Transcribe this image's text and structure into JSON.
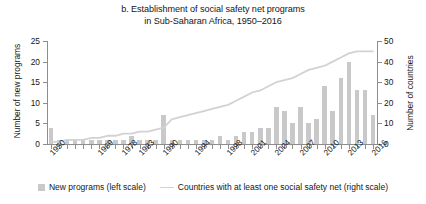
{
  "title": {
    "line1": "b. Establishment of social safety net programs",
    "line2": "in Sub-Saharan Africa, 1950–2016"
  },
  "axes": {
    "left_title": "Number of new programs",
    "right_title": "Number of countries",
    "left_ticks": [
      "0",
      "5",
      "10",
      "15",
      "20",
      "25"
    ],
    "right_ticks": [
      "0",
      "10",
      "20",
      "30",
      "40",
      "50"
    ],
    "x_ticks": [
      "1950",
      "1969",
      "1978",
      "1983",
      "1990",
      "1994",
      "1998",
      "2001",
      "2004",
      "2007",
      "2010",
      "2013",
      "2016"
    ]
  },
  "legend": {
    "bars_label": "New programs (left scale)",
    "line_label": "Countries with at least one social safety net (right scale)",
    "bar_color": "#c9c9c9",
    "line_color": "#d2d2d2"
  },
  "chart_data": {
    "type": "bar",
    "title": "b. Establishment of social safety net programs in Sub-Saharan Africa, 1950–2016",
    "xlabel": "",
    "ylabel": "Number of new programs",
    "y2label": "Number of countries",
    "ylim": [
      0,
      25
    ],
    "y2lim": [
      0,
      50
    ],
    "grid": false,
    "legend_position": "bottom",
    "categories": [
      "1950",
      "1953",
      "1956",
      "1959",
      "1962",
      "1965",
      "1969",
      "1972",
      "1975",
      "1978",
      "1981",
      "1983",
      "1986",
      "1988",
      "1990",
      "1991",
      "1992",
      "1993",
      "1994",
      "1995",
      "1996",
      "1997",
      "1998",
      "1999",
      "2000",
      "2001",
      "2002",
      "2003",
      "2004",
      "2005",
      "2006",
      "2007",
      "2008",
      "2009",
      "2010",
      "2011",
      "2012",
      "2013",
      "2014",
      "2015",
      "2016"
    ],
    "series": [
      {
        "name": "New programs (left scale)",
        "type": "bar",
        "axis": "left",
        "values": [
          4,
          1,
          1,
          1,
          1,
          1,
          1,
          1,
          1,
          1,
          2,
          1,
          1,
          1,
          7,
          1,
          1,
          1,
          1,
          1,
          1,
          2,
          1,
          2,
          3,
          3,
          4,
          4,
          9,
          8,
          5,
          9,
          5,
          6,
          14,
          8,
          16,
          20,
          13,
          13,
          7
        ]
      },
      {
        "name": "Countries with at least one social safety net (right scale)",
        "type": "line",
        "axis": "right",
        "values": [
          1,
          1,
          2,
          2,
          2,
          3,
          3,
          4,
          4,
          5,
          5,
          6,
          6,
          7,
          8,
          12,
          13,
          14,
          15,
          16,
          17,
          18,
          19,
          21,
          23,
          25,
          26,
          28,
          30,
          31,
          32,
          34,
          36,
          37,
          38,
          40,
          42,
          44,
          45,
          45,
          45
        ]
      }
    ]
  }
}
